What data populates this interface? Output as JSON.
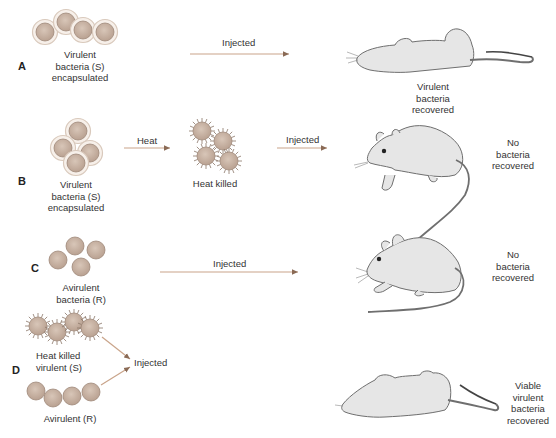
{
  "colors": {
    "bacteria_fill": "#c9b3a3",
    "bacteria_stroke": "#a89283",
    "capsule": "#e8dcd2",
    "arrow": "#c9a48a",
    "mouse_fill": "#e6e6e6",
    "mouse_stroke": "#777777"
  },
  "rows": [
    {
      "letter": "A",
      "bacteria_label": [
        "Virulent",
        "bacteria (S)",
        "encapsulated"
      ],
      "bacteria_type": "encapsulated",
      "steps": [
        {
          "label": "Injected"
        }
      ],
      "mouse_state": "dead",
      "outcome": [
        "Virulent",
        "bacteria",
        "recovered"
      ]
    },
    {
      "letter": "B",
      "bacteria_label": [
        "Virulent",
        "bacteria (S)",
        "encapsulated"
      ],
      "bacteria_type": "encapsulated",
      "steps": [
        {
          "label": "Heat"
        },
        {
          "label": "Injected"
        }
      ],
      "intermediate_label": "Heat killed",
      "mouse_state": "alive",
      "outcome": [
        "No",
        "bacteria",
        "recovered"
      ]
    },
    {
      "letter": "C",
      "bacteria_label": [
        "Avirulent",
        "bacteria (R)"
      ],
      "bacteria_type": "rough",
      "steps": [
        {
          "label": "Injected"
        }
      ],
      "mouse_state": "alive",
      "outcome": [
        "No",
        "bacteria",
        "recovered"
      ]
    },
    {
      "letter": "D",
      "bacteria_label_top": [
        "Heat killed",
        "virulent (S)"
      ],
      "bacteria_label_bottom": "Avirulent (R)",
      "steps": [
        {
          "label": "Injected"
        }
      ],
      "mouse_state": "dead",
      "outcome": [
        "Viable",
        "virulent",
        "bacteria",
        "recovered"
      ]
    }
  ]
}
